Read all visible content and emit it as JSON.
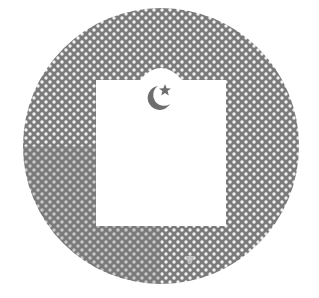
{
  "figure": {
    "colors": {
      "background": "#ffffff",
      "disc": "#7a7a7a",
      "dots": "#f2f2f2",
      "panel": "#ffffff",
      "emblem": "#6e6e6e"
    },
    "icons": [
      "crescent-moon-icon",
      "star-icon",
      "small-mark-icon"
    ]
  }
}
